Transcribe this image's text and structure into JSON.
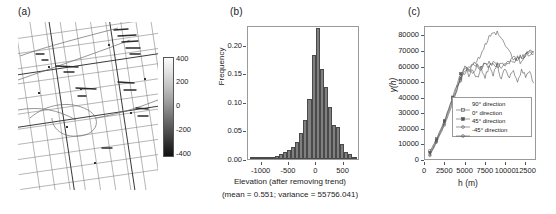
{
  "figure": {
    "panels": [
      {
        "id": "a",
        "label": "(a)"
      },
      {
        "id": "b",
        "label": "(b)"
      },
      {
        "id": "c",
        "label": "(c)"
      }
    ]
  },
  "panel_a": {
    "label": "(a)",
    "description": "grayscale raster map of road/street grid network",
    "colorbar": {
      "ticks": [
        "400",
        "200",
        "0",
        "-200",
        "-400"
      ],
      "vmin": -500,
      "vmax": 500,
      "orientation": "vertical",
      "colormap": "gray"
    }
  },
  "chart_data": [
    {
      "panel": "b",
      "type": "bar",
      "title": "",
      "xlabel": "Elevation (after removing trend)",
      "ylabel": "Frequency",
      "annotation": "(mean = 0.551;  variance = 55756.041)",
      "xlim": [
        -1250,
        800
      ],
      "ylim": [
        0.0,
        0.235
      ],
      "xticks": [
        -1000,
        -500,
        0,
        500
      ],
      "xticklabels": [
        "-1000",
        "-500",
        "0",
        "500"
      ],
      "yticks": [
        0.0,
        0.05,
        0.1,
        0.15,
        0.2
      ],
      "yticklabels": [
        "0.00",
        "0.05",
        "0.10",
        "0.15",
        "0.20"
      ],
      "grid": false,
      "bin_width": 75,
      "bin_centers": [
        -1175,
        -1100,
        -1025,
        -950,
        -875,
        -800,
        -725,
        -650,
        -575,
        -500,
        -425,
        -350,
        -275,
        -200,
        -125,
        -50,
        25,
        100,
        175,
        250,
        325,
        400,
        475,
        550,
        625,
        700
      ],
      "values": [
        0.001,
        0.001,
        0.002,
        0.002,
        0.003,
        0.004,
        0.006,
        0.009,
        0.013,
        0.015,
        0.021,
        0.029,
        0.046,
        0.068,
        0.105,
        0.183,
        0.23,
        0.157,
        0.127,
        0.091,
        0.06,
        0.057,
        0.027,
        0.012,
        0.009,
        0.003
      ],
      "bar_color": "#808080",
      "bar_edge_color": "#4a4a4a"
    },
    {
      "panel": "c",
      "type": "line",
      "title": "",
      "xlabel": "h (m)",
      "ylabel": "γ(h)",
      "xlim": [
        0,
        13800
      ],
      "ylim": [
        0,
        86000
      ],
      "xticks": [
        0,
        2500,
        5000,
        7500,
        10000,
        12500
      ],
      "xticklabels": [
        "0",
        "2500",
        "5000",
        "7500",
        "10000",
        "12500"
      ],
      "yticks": [
        0,
        10000,
        20000,
        30000,
        40000,
        50000,
        60000,
        70000,
        80000
      ],
      "yticklabels": [
        "0",
        "10000",
        "20000",
        "30000",
        "40000",
        "50000",
        "60000",
        "70000",
        "80000"
      ],
      "grid": false,
      "legend_position": "lower right",
      "series": [
        {
          "name": "90° direction",
          "marker": "triangle",
          "color": "#555555",
          "x": [
            600,
            1000,
            1400,
            1900,
            2400,
            2900,
            3400,
            3900,
            4400,
            4900,
            5400,
            5900,
            6400,
            6900,
            7400,
            7900,
            8400,
            8900,
            9400,
            9900,
            10400,
            10900,
            11400,
            11900,
            12400,
            12900,
            13400
          ],
          "y": [
            6500,
            10000,
            14500,
            19500,
            26000,
            33000,
            40000,
            47000,
            52000,
            57000,
            61000,
            62000,
            64000,
            69000,
            74000,
            79000,
            81000,
            82000,
            78000,
            74000,
            70000,
            66000,
            65000,
            66000,
            68000,
            70000,
            69000
          ]
        },
        {
          "name": "0° direction",
          "marker": "square",
          "color": "#555555",
          "x": [
            600,
            1000,
            1400,
            1900,
            2400,
            2900,
            3400,
            3900,
            4400,
            4900,
            5400,
            5900,
            6400,
            6900,
            7400,
            7900,
            8400,
            8900,
            9400,
            9900,
            10400,
            10900,
            11400,
            11900,
            12400,
            12900,
            13400
          ],
          "y": [
            5500,
            9000,
            13500,
            19000,
            25500,
            33000,
            41000,
            49000,
            56000,
            60000,
            58000,
            61000,
            62000,
            60000,
            62000,
            63000,
            62000,
            62000,
            61000,
            63000,
            64000,
            65000,
            66000,
            67000,
            68000,
            70000,
            70000
          ]
        },
        {
          "name": "45° direction",
          "marker": "circle",
          "color": "#555555",
          "x": [
            600,
            1000,
            1400,
            1900,
            2400,
            2900,
            3400,
            3900,
            4400,
            4900,
            5400,
            5900,
            6400,
            6900,
            7400,
            7900,
            8400,
            8900,
            9400,
            9900,
            10400,
            10900,
            11400,
            11900,
            12400,
            12900,
            13400
          ],
          "y": [
            4000,
            8000,
            12500,
            18000,
            24000,
            31000,
            38000,
            46000,
            54000,
            58000,
            60000,
            56000,
            61000,
            59000,
            63000,
            60000,
            64000,
            61000,
            63000,
            62000,
            64000,
            62000,
            66000,
            63000,
            68000,
            69000,
            70000
          ]
        },
        {
          "name": "-45° direction",
          "marker": "star",
          "color": "#555555",
          "x": [
            600,
            1000,
            1400,
            1900,
            2400,
            2900,
            3400,
            3900,
            4400,
            4900,
            5400,
            5900,
            6400,
            6900,
            7400,
            7900,
            8400,
            8900,
            9400,
            9900,
            10400,
            10900,
            11400,
            11900,
            12400,
            12900,
            13400
          ],
          "y": [
            3500,
            7500,
            12000,
            17500,
            23000,
            30000,
            37000,
            45000,
            53000,
            61000,
            55000,
            59000,
            53000,
            60000,
            54000,
            61000,
            55000,
            62000,
            52000,
            60000,
            53000,
            58000,
            51000,
            59000,
            54000,
            58000,
            50000
          ]
        }
      ]
    }
  ]
}
